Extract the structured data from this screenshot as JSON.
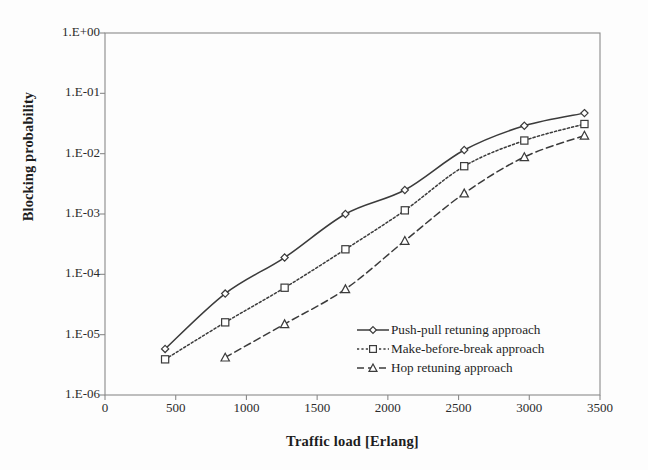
{
  "chart_data": {
    "type": "line",
    "title": "",
    "xlabel": "Traffic load [Erlang]",
    "ylabel": "Blocking probability",
    "xlim": [
      0,
      3500
    ],
    "ylim": [
      1e-06,
      1.0
    ],
    "yscale": "log",
    "xticks": [
      0,
      500,
      1000,
      1500,
      2000,
      2500,
      3000,
      3500
    ],
    "xtick_labels": [
      "0",
      "500",
      "1000",
      "1500",
      "2000",
      "2500",
      "3000",
      "3500"
    ],
    "yticks": [
      1.0,
      0.1,
      0.01,
      0.001,
      0.0001,
      1e-05,
      1e-06
    ],
    "ytick_labels": [
      "1.E+00",
      "1.E-01",
      "1.E-02",
      "1.E-03",
      "1.E-04",
      "1.E-05",
      "1.E-06"
    ],
    "grid": false,
    "legend_position": "center-right-inside",
    "series": [
      {
        "name": "Push-pull retuning approach",
        "marker": "diamond",
        "linestyle": "solid",
        "color": "#3b3b3b",
        "x": [
          425,
          850,
          1270,
          1700,
          2120,
          2540,
          2965,
          3390
        ],
        "y": [
          5.8e-06,
          4.8e-05,
          0.00019,
          0.001,
          0.0025,
          0.0115,
          0.029,
          0.047
        ]
      },
      {
        "name": "Make-before-break approach",
        "marker": "square",
        "linestyle": "dotted",
        "color": "#3b3b3b",
        "x": [
          425,
          850,
          1270,
          1700,
          2120,
          2540,
          2965,
          3390
        ],
        "y": [
          3.9e-06,
          1.6e-05,
          6e-05,
          0.00026,
          0.00115,
          0.0062,
          0.0165,
          0.031
        ]
      },
      {
        "name": "Hop retuning approach",
        "marker": "triangle",
        "linestyle": "dashed",
        "color": "#3b3b3b",
        "x": [
          850,
          1270,
          1700,
          2120,
          2540,
          2965,
          3390
        ],
        "y": [
          4.2e-06,
          1.5e-05,
          5.7e-05,
          0.00036,
          0.0022,
          0.0088,
          0.02
        ]
      }
    ]
  },
  "axes": {
    "y_title": "Blocking probability",
    "x_title": "Traffic load [Erlang]"
  },
  "legend": {
    "items": [
      {
        "label": "Push-pull retuning approach",
        "marker": "diamond-marker-icon",
        "style": "solid"
      },
      {
        "label": "Make-before-break approach",
        "marker": "square-marker-icon",
        "style": "dotted"
      },
      {
        "label": "Hop retuning approach",
        "marker": "triangle-marker-icon",
        "style": "dashed"
      }
    ]
  },
  "colors": {
    "line": "#3b3b3b",
    "frame": "#8a8a8a",
    "text": "#1d1d1d",
    "background": "#fdfdfd",
    "marker_fill": "#ffffff"
  }
}
